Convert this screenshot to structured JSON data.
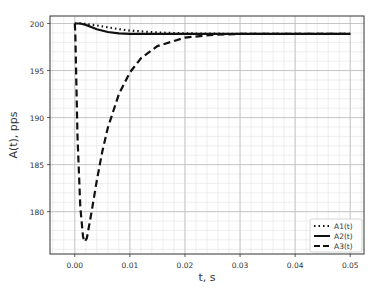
{
  "chart_data": {
    "type": "line",
    "title": "",
    "xlabel": "t, s",
    "ylabel": "A(t), pps",
    "xlim": [
      -0.0045,
      0.0525
    ],
    "ylim": [
      175.5,
      200.8
    ],
    "xticks": [
      0.0,
      0.01,
      0.02,
      0.03,
      0.04,
      0.05
    ],
    "xtick_labels": [
      "0.00",
      "0.01",
      "0.02",
      "0.03",
      "0.04",
      "0.05"
    ],
    "yticks": [
      180,
      185,
      190,
      195,
      200
    ],
    "ytick_labels": [
      "180",
      "185",
      "190",
      "195",
      "200"
    ],
    "grid": true,
    "minor_grid": true,
    "legend_position": "lower right",
    "series": [
      {
        "name": "A1(t)",
        "style": "dotted",
        "x": [
          0.0,
          0.001,
          0.002,
          0.004,
          0.006,
          0.008,
          0.01,
          0.015,
          0.02,
          0.03,
          0.04,
          0.05
        ],
        "y": [
          200.0,
          200.0,
          199.95,
          199.8,
          199.6,
          199.4,
          199.25,
          199.05,
          198.95,
          198.9,
          198.9,
          198.9
        ]
      },
      {
        "name": "A2(t)",
        "style": "solid",
        "x": [
          0.0,
          0.001,
          0.002,
          0.004,
          0.006,
          0.008,
          0.01,
          0.015,
          0.02,
          0.03,
          0.04,
          0.05
        ],
        "y": [
          200.0,
          200.0,
          199.85,
          199.4,
          199.1,
          198.95,
          198.9,
          198.9,
          198.9,
          198.9,
          198.9,
          198.9
        ]
      },
      {
        "name": "A3(t)",
        "style": "dashed",
        "x": [
          0.0,
          0.0001,
          0.0005,
          0.001,
          0.0015,
          0.0018,
          0.0022,
          0.003,
          0.004,
          0.005,
          0.006,
          0.008,
          0.01,
          0.012,
          0.015,
          0.02,
          0.025,
          0.03,
          0.04,
          0.05
        ],
        "y": [
          200.0,
          199.0,
          188.0,
          180.5,
          177.3,
          176.8,
          177.2,
          179.8,
          183.3,
          186.4,
          188.9,
          192.5,
          194.8,
          196.3,
          197.6,
          198.5,
          198.8,
          198.9,
          198.9,
          198.9
        ]
      }
    ]
  }
}
